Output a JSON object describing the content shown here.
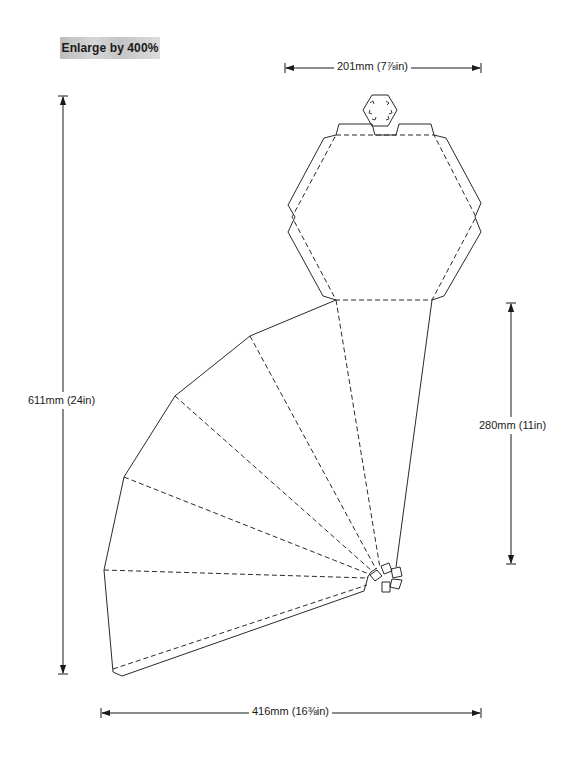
{
  "header": {
    "badge_text": "Enlarge by 400%"
  },
  "dimensions": {
    "top_width": {
      "text": "201mm (7⅞in)",
      "mm": 201,
      "inches": "7 7/8"
    },
    "total_height": {
      "text": "611mm (24in)",
      "mm": 611,
      "inches": "24"
    },
    "fan_height": {
      "text": "280mm (11in)",
      "mm": 280,
      "inches": "11"
    },
    "total_width": {
      "text": "416mm (16⅜in)",
      "mm": 416,
      "inches": "16 3/8"
    }
  },
  "diagram": {
    "line_styles": {
      "cut_line": "solid",
      "fold_line": "dashed"
    },
    "colors": {
      "stroke": "#2a2a2a",
      "background": "#ffffff",
      "badge_bg": "#c8c8c8"
    },
    "parts": [
      {
        "name": "hexagon-lid",
        "sides": 6
      },
      {
        "name": "hexagon-cap",
        "sides": 6
      },
      {
        "name": "cone-fan",
        "segments": 6
      },
      {
        "name": "apex-tabs",
        "count": 5
      }
    ]
  }
}
